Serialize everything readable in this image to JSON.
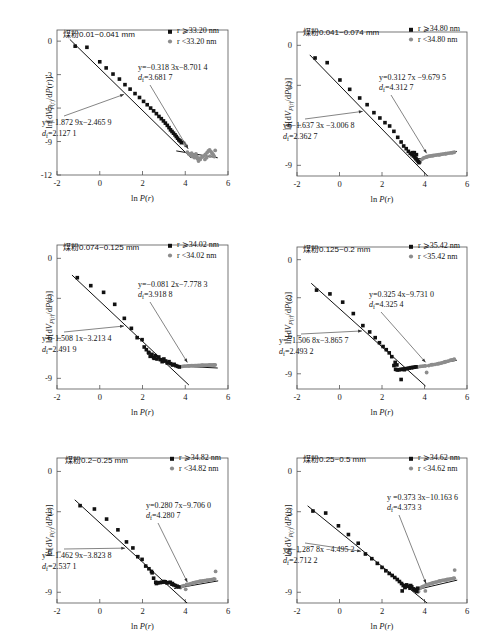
{
  "figure": {
    "axis": {
      "xlabel": "ln P(r)",
      "ylabel": "ln[dV_P(r)/dP(r)]",
      "xticks": [
        "-2",
        "0",
        "2",
        "4",
        "6"
      ],
      "xlim": [
        -2,
        6
      ],
      "yticks_long": [
        "0",
        "-3",
        "-6",
        "-9",
        "-12"
      ],
      "yticks_short": [
        "0",
        "-3",
        "-6",
        "-9"
      ]
    },
    "legend": {
      "marker_large": "black-square",
      "marker_small": "gray-circle"
    }
  },
  "chart_data": [
    {
      "type": "scatter",
      "id": "panel-1",
      "title": "煤粉0.01~0.041 mm",
      "legend": [
        "r ⩾33.20 nm",
        "r <33.20 nm"
      ],
      "threshold_nm": 33.2,
      "xlabel": "ln P(r)",
      "ylabel": "ln[dV_P(r)/dP(r)]",
      "xlim": [
        -2,
        6
      ],
      "ylim": [
        -12,
        1
      ],
      "yticks": [
        "0",
        "-3",
        "-6",
        "-9",
        "-12"
      ],
      "fit_large": {
        "equation": "y=−0.318 3x−8.701 4",
        "slope": -0.3183,
        "intercept": -8.7014,
        "df_label": "dₑ=3.681 7",
        "df": 3.6817
      },
      "fit_small": {
        "equation": "y=−1.872 9x−2.465 9",
        "slope": -1.8729,
        "intercept": -2.4659,
        "df_label": "dₑ=2.127 1",
        "df": 2.1271
      },
      "series_large": {
        "name": "r ⩾33.20 nm",
        "x": [
          -1.15,
          -0.6,
          0.0,
          0.3,
          0.62,
          0.92,
          1.18,
          1.42,
          1.65,
          1.86,
          2.05,
          2.22,
          2.38,
          2.52,
          2.65,
          2.77,
          2.88,
          2.98,
          3.07,
          3.16,
          3.24,
          3.31,
          3.38,
          3.45,
          3.52,
          3.58,
          3.64,
          3.7,
          3.76,
          3.82
        ],
        "y": [
          -0.45,
          -0.55,
          -1.85,
          -2.4,
          -2.95,
          -3.4,
          -3.9,
          -4.3,
          -4.7,
          -5.05,
          -5.4,
          -5.7,
          -6.0,
          -6.25,
          -6.5,
          -6.75,
          -6.95,
          -7.15,
          -7.35,
          -7.55,
          -7.75,
          -7.95,
          -8.1,
          -8.25,
          -8.4,
          -8.55,
          -8.7,
          -8.85,
          -8.95,
          -9.1
        ]
      },
      "series_small": {
        "name": "r <33.20 nm",
        "x": [
          3.88,
          3.95,
          4.02,
          4.1,
          4.18,
          4.26,
          4.34,
          4.42,
          4.5,
          4.58,
          4.62,
          4.7,
          4.78,
          4.86,
          4.94,
          5.02,
          5.08,
          5.14,
          5.2,
          5.26,
          5.32,
          5.36,
          5.4,
          4.44,
          4.68,
          4.92,
          5.16,
          4.3,
          4.55,
          5.0
        ],
        "y": [
          -9.05,
          -9.15,
          -9.35,
          -9.95,
          -10.15,
          -10.25,
          -10.35,
          -10.2,
          -10.1,
          -10.55,
          -10.75,
          -10.6,
          -10.4,
          -10.3,
          -10.15,
          -10.0,
          -9.85,
          -9.75,
          -9.9,
          -10.05,
          -10.2,
          -10.35,
          -9.8,
          -10.45,
          -10.5,
          -10.6,
          -10.3,
          -10.05,
          -10.35,
          -10.45
        ]
      }
    },
    {
      "type": "scatter",
      "id": "panel-2",
      "title": "煤粉0.041~0.074 mm",
      "legend": [
        "r ⩾34.80 nm",
        "r <34.80 nm"
      ],
      "threshold_nm": 34.8,
      "xlabel": "ln P(r)",
      "ylabel": "ln[dV_P(r)/dP(r)]",
      "xlim": [
        -2,
        6
      ],
      "ylim": [
        -9.8,
        1
      ],
      "yticks": [
        "0",
        "-3",
        "-6",
        "-9"
      ],
      "fit_large": {
        "equation": "y=0.312 7x −9.679 5",
        "slope": 0.3127,
        "intercept": -9.6795,
        "df_label": "dₑ=4.312 7",
        "df": 4.3127
      },
      "fit_small": {
        "equation": "y=−1.637 3x −3.006 8",
        "slope": -1.6373,
        "intercept": -3.0068,
        "df_label": "dₑ=2.362 7",
        "df": 2.3627
      },
      "series_large": {
        "name": "r ⩾34.80 nm",
        "x": [
          -1.15,
          -0.58,
          0.02,
          0.48,
          0.95,
          1.3,
          1.62,
          1.9,
          2.14,
          2.36,
          2.56,
          2.74,
          2.9,
          3.02,
          3.14,
          3.24,
          3.33,
          3.41,
          3.48,
          3.55,
          3.6,
          3.65,
          3.7,
          3.74,
          3.62,
          3.52,
          3.44
        ],
        "y": [
          -0.95,
          -1.3,
          -2.6,
          -3.3,
          -3.95,
          -4.45,
          -5.05,
          -5.45,
          -5.8,
          -6.05,
          -6.45,
          -6.9,
          -7.25,
          -7.55,
          -7.75,
          -7.95,
          -8.1,
          -8.2,
          -8.3,
          -8.4,
          -8.5,
          -8.6,
          -8.7,
          -8.8,
          -8.2,
          -8.05,
          -8.05
        ]
      },
      "series_small": {
        "name": "r <34.80 nm",
        "x": [
          3.8,
          3.88,
          3.96,
          4.04,
          4.12,
          4.2,
          4.28,
          4.36,
          4.44,
          4.52,
          4.6,
          4.68,
          4.76,
          4.84,
          4.92,
          5.0,
          5.08,
          5.16,
          5.24,
          5.32,
          5.4,
          4.1,
          4.4,
          4.7,
          5.0,
          5.3
        ],
        "y": [
          -8.75,
          -8.55,
          -8.45,
          -8.4,
          -8.35,
          -8.32,
          -8.3,
          -8.28,
          -8.26,
          -8.24,
          -8.22,
          -8.2,
          -8.18,
          -8.16,
          -8.14,
          -8.12,
          -8.1,
          -8.08,
          -8.06,
          -8.04,
          -8.02,
          -8.38,
          -8.27,
          -8.21,
          -8.13,
          -8.05
        ]
      }
    },
    {
      "type": "scatter",
      "id": "panel-3",
      "title": "煤粉0.074~0.125 mm",
      "legend": [
        "r ⩾34.02 nm",
        "r <34.02 nm"
      ],
      "threshold_nm": 34.02,
      "xlabel": "ln P(r)",
      "ylabel": "ln[dV_P(r)/dP(r)]",
      "xlim": [
        -2,
        6
      ],
      "ylim": [
        -9.8,
        1
      ],
      "yticks": [
        "0",
        "-3",
        "-6",
        "-9"
      ],
      "fit_large": {
        "equation": "y=−0.081 2x−7.778 3",
        "slope": -0.0812,
        "intercept": -7.7783,
        "df_label": "dₑ=3.918 8",
        "df": 3.9188
      },
      "fit_small": {
        "equation": "y=−1.508 1x−3.213 4",
        "slope": -1.5081,
        "intercept": -3.2134,
        "df_label": "dₑ=2.491 9",
        "df": 2.4919
      },
      "series_large": {
        "name": "r ⩾34.02 nm",
        "x": [
          -1.05,
          -0.42,
          0.18,
          0.7,
          1.15,
          1.48,
          1.75,
          1.98,
          2.08,
          2.18,
          2.28,
          2.36,
          2.44,
          2.52,
          2.6,
          2.68,
          2.76,
          2.84,
          2.92,
          3.0,
          3.08,
          3.16,
          3.24,
          3.32,
          3.4,
          3.48,
          3.56,
          3.64,
          3.72,
          2.3,
          2.55,
          2.95
        ],
        "y": [
          -1.45,
          -2.05,
          -2.55,
          -3.45,
          -4.5,
          -5.25,
          -5.95,
          -6.1,
          -6.65,
          -6.85,
          -7.05,
          -7.35,
          -7.2,
          -7.45,
          -7.3,
          -7.55,
          -7.4,
          -7.6,
          -7.75,
          -7.55,
          -7.7,
          -7.85,
          -7.75,
          -7.9,
          -8.0,
          -7.95,
          -8.05,
          -8.1,
          -8.15,
          -7.1,
          -7.5,
          -7.65
        ]
      },
      "series_small": {
        "name": "r <34.02 nm",
        "x": [
          3.8,
          3.88,
          3.96,
          4.04,
          4.12,
          4.2,
          4.28,
          4.36,
          4.44,
          4.52,
          4.6,
          4.68,
          4.76,
          4.84,
          4.92,
          5.0,
          5.08,
          5.16,
          5.24,
          5.32,
          5.4,
          4.16,
          4.48,
          4.8,
          5.12,
          5.36
        ],
        "y": [
          -8.12,
          -8.1,
          -8.08,
          -8.08,
          -8.06,
          -8.06,
          -8.05,
          -8.05,
          -8.04,
          -8.04,
          -8.03,
          -8.03,
          -8.02,
          -8.02,
          -8.02,
          -8.01,
          -8.01,
          -8.0,
          -8.0,
          -8.0,
          -7.99,
          -8.07,
          -8.04,
          -8.03,
          -8.01,
          -8.0
        ]
      }
    },
    {
      "type": "scatter",
      "id": "panel-4",
      "title": "煤粉0.125~0.2 mm",
      "legend": [
        "r ⩾35.42 nm",
        "r <35.42 nm"
      ],
      "threshold_nm": 35.42,
      "xlabel": "ln P(r)",
      "ylabel": "ln[dV_P(r)/dP(r)]",
      "xlim": [
        -2,
        6
      ],
      "ylim": [
        -10.2,
        1
      ],
      "yticks": [
        "0",
        "-3",
        "-6",
        "-9"
      ],
      "fit_large": {
        "equation": "y=0.325 4x−9.731 0",
        "slope": 0.3254,
        "intercept": -9.731,
        "df_label": "dₑ=4.325 4",
        "df": 4.3254
      },
      "fit_small": {
        "equation": "y=−1.506 8x−3.865 7",
        "slope": -1.5068,
        "intercept": -3.8657,
        "df_label": "dₑ=2.493 2",
        "df": 2.4932
      },
      "series_large": {
        "name": "r ⩾35.42 nm",
        "x": [
          -1.08,
          -0.45,
          0.15,
          0.65,
          1.1,
          1.42,
          1.68,
          1.88,
          2.05,
          2.2,
          2.34,
          2.46,
          2.56,
          2.64,
          2.72,
          2.8,
          2.88,
          2.96,
          3.04,
          3.12,
          3.2,
          3.28,
          3.36,
          3.44,
          3.52,
          3.6,
          2.62,
          2.7,
          2.9,
          3.05
        ],
        "y": [
          -2.4,
          -2.7,
          -3.35,
          -4.25,
          -5.2,
          -5.7,
          -6.15,
          -6.55,
          -6.85,
          -7.1,
          -7.35,
          -7.65,
          -8.35,
          -8.65,
          -8.7,
          -8.68,
          -8.66,
          -8.64,
          -8.62,
          -8.6,
          -8.58,
          -8.55,
          -8.52,
          -8.5,
          -8.48,
          -8.45,
          -8.1,
          -8.3,
          -9.45,
          -8.68
        ]
      },
      "series_small": {
        "name": "r <35.42 nm",
        "x": [
          3.7,
          3.8,
          3.9,
          4.0,
          4.1,
          4.2,
          4.3,
          4.4,
          4.5,
          4.6,
          4.7,
          4.8,
          4.9,
          5.0,
          5.1,
          5.2,
          5.3,
          5.4,
          4.05,
          4.35,
          4.65,
          4.95,
          5.25,
          5.38
        ],
        "y": [
          -8.45,
          -8.42,
          -8.4,
          -8.38,
          -8.9,
          -8.35,
          -8.3,
          -8.28,
          -8.25,
          -8.22,
          -8.18,
          -8.15,
          -8.1,
          -8.05,
          -8.0,
          -7.95,
          -7.9,
          -7.85,
          -8.37,
          -8.27,
          -8.2,
          -8.07,
          -7.92,
          -7.88
        ]
      }
    },
    {
      "type": "scatter",
      "id": "panel-5",
      "title": "煤粉0.2~0.25 mm",
      "legend": [
        "r ⩾34.82 nm",
        "r <34.82 nm"
      ],
      "threshold_nm": 34.82,
      "xlabel": "ln P(r)",
      "ylabel": "ln[dV_P(r)/dP(r)]",
      "xlim": [
        -2,
        6
      ],
      "ylim": [
        -9.8,
        1
      ],
      "yticks": [
        "0",
        "-3",
        "-6",
        "-9"
      ],
      "fit_large": {
        "equation": "y=0.280 7x−9.706 0",
        "slope": 0.2807,
        "intercept": -9.706,
        "df_label": "dₑ=4.280 7",
        "df": 4.2807
      },
      "fit_small": {
        "equation": "y=−1.462 9x−3.823 8",
        "slope": -1.4629,
        "intercept": -3.8238,
        "df_label": "dₑ=2.537 1",
        "df": 2.5371
      },
      "series_large": {
        "name": "r ⩾34.82 nm",
        "x": [
          -0.92,
          -0.25,
          0.32,
          0.85,
          1.25,
          1.55,
          1.78,
          1.98,
          2.15,
          2.3,
          2.42,
          2.52,
          2.62,
          2.72,
          2.82,
          2.9,
          2.98,
          3.06,
          3.14,
          3.22,
          3.3,
          3.38,
          3.46,
          3.54,
          3.62,
          3.7,
          2.45,
          2.65,
          3.0,
          3.4
        ],
        "y": [
          -2.55,
          -2.8,
          -3.55,
          -4.35,
          -5.25,
          -5.7,
          -6.35,
          -6.55,
          -7.05,
          -7.25,
          -7.45,
          -7.95,
          -8.25,
          -8.3,
          -8.28,
          -8.26,
          -8.24,
          -8.22,
          -8.3,
          -8.28,
          -8.26,
          -8.4,
          -8.45,
          -8.5,
          -8.55,
          -8.6,
          -7.55,
          -8.35,
          -8.2,
          -8.35
        ]
      },
      "series_small": {
        "name": "r <34.82 nm",
        "x": [
          3.78,
          3.86,
          3.94,
          4.02,
          4.1,
          4.18,
          4.26,
          4.34,
          4.42,
          4.5,
          4.58,
          4.66,
          4.74,
          4.82,
          4.9,
          4.98,
          5.06,
          5.14,
          5.22,
          5.3,
          5.38,
          5.42,
          4.06,
          4.38,
          4.7,
          5.02,
          5.34
        ],
        "y": [
          -8.65,
          -8.55,
          -8.5,
          -8.78,
          -8.45,
          -8.4,
          -8.36,
          -8.32,
          -8.28,
          -8.25,
          -8.22,
          -8.2,
          -8.18,
          -8.16,
          -8.14,
          -8.12,
          -8.1,
          -8.08,
          -8.06,
          -8.04,
          -8.02,
          -7.45,
          -8.42,
          -8.3,
          -8.19,
          -8.11,
          -8.03
        ]
      }
    },
    {
      "type": "scatter",
      "id": "panel-6",
      "title": "煤粉0.25~0.5 mm",
      "legend": [
        "r ⩾34.62 nm",
        "r <34.62 nm"
      ],
      "threshold_nm": 34.62,
      "xlabel": "ln P(r)",
      "ylabel": "ln[dV_P(r)/dP(r)]",
      "xlim": [
        -2,
        6
      ],
      "ylim": [
        -9.8,
        1
      ],
      "yticks": [
        "0",
        "-3",
        "-6",
        "-9"
      ],
      "fit_large": {
        "equation": "y =0.373 3x−10.163 6",
        "slope": 0.3733,
        "intercept": -10.1636,
        "df_label": "dₑ=4.373 3",
        "df": 4.3733
      },
      "fit_small": {
        "equation": "y=−1.287 8x −4.495 2",
        "slope": -1.2878,
        "intercept": -4.4952,
        "df_label": "dₑ=2.712 2",
        "df": 2.7122
      },
      "series_large": {
        "name": "r ⩾34.62 nm",
        "x": [
          -1.25,
          -0.65,
          -0.05,
          0.42,
          0.88,
          1.22,
          1.52,
          1.78,
          2.0,
          2.18,
          2.34,
          2.48,
          2.6,
          2.72,
          2.82,
          2.92,
          3.0,
          3.08,
          3.16,
          3.24,
          3.32,
          3.4,
          3.48,
          3.56,
          3.64,
          2.95,
          3.1,
          3.35,
          3.55,
          3.68
        ],
        "y": [
          -2.95,
          -3.1,
          -4.05,
          -4.7,
          -5.35,
          -6.15,
          -6.5,
          -6.85,
          -7.15,
          -7.4,
          -7.6,
          -7.75,
          -7.9,
          -8.05,
          -8.2,
          -8.35,
          -8.5,
          -8.65,
          -8.45,
          -8.55,
          -8.7,
          -8.6,
          -8.75,
          -8.85,
          -8.95,
          -8.9,
          -8.6,
          -8.5,
          -8.8,
          -8.7
        ]
      },
      "series_small": {
        "name": "r <34.62 nm",
        "x": [
          3.72,
          3.8,
          3.88,
          3.96,
          4.04,
          4.12,
          4.2,
          4.28,
          4.36,
          4.44,
          4.52,
          4.6,
          4.68,
          4.76,
          4.84,
          4.92,
          5.0,
          5.08,
          5.16,
          5.24,
          5.32,
          5.4,
          5.42,
          4.08,
          4.4,
          4.72,
          5.04,
          5.36
        ],
        "y": [
          -8.95,
          -8.7,
          -8.6,
          -8.55,
          -8.9,
          -8.45,
          -8.4,
          -8.36,
          -8.32,
          -8.28,
          -8.25,
          -8.22,
          -8.18,
          -8.15,
          -8.12,
          -8.1,
          -8.08,
          -8.05,
          -8.02,
          -8.0,
          -7.98,
          -7.95,
          -7.35,
          -8.42,
          -8.3,
          -8.17,
          -8.07,
          -7.97
        ]
      }
    }
  ]
}
